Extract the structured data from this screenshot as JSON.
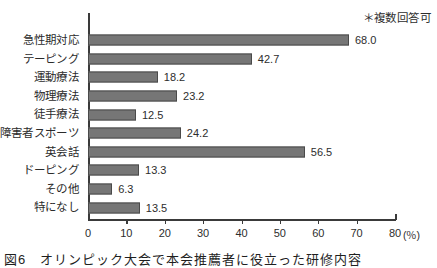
{
  "note": "＊複数回答可",
  "caption": "図6　オリンピック大会で本会推薦者に役立った研修内容",
  "axis": {
    "unit": "(％)",
    "ticks": [
      0,
      10,
      20,
      30,
      40,
      50,
      60,
      70,
      80
    ],
    "tick_labels": [
      "0",
      "10",
      "20",
      "30",
      "40",
      "50",
      "60",
      "70",
      "80"
    ]
  },
  "colors": {
    "bar_fill": "#767676",
    "bar_border": "#4a4a4a",
    "axis": "#3a3a3a",
    "text": "#2b2b2b",
    "background": "#ffffff"
  },
  "chart_data": {
    "type": "bar",
    "orientation": "horizontal",
    "title": "図6　オリンピック大会で本会推薦者に役立った研修内容",
    "xlabel": "(％)",
    "ylabel": "",
    "xlim": [
      0,
      80
    ],
    "grid": false,
    "legend": false,
    "annotation": "＊複数回答可",
    "categories": [
      "急性期対応",
      "テーピング",
      "運動療法",
      "物理療法",
      "徒手療法",
      "障害者スポーツ",
      "英会話",
      "ドーピング",
      "その他",
      "特になし"
    ],
    "values": [
      68.0,
      42.7,
      18.2,
      23.2,
      12.5,
      24.2,
      56.5,
      13.3,
      6.3,
      13.5
    ],
    "value_labels": [
      "68.0",
      "42.7",
      "18.2",
      "23.2",
      "12.5",
      "24.2",
      "56.5",
      "13.3",
      "6.3",
      "13.5"
    ]
  }
}
